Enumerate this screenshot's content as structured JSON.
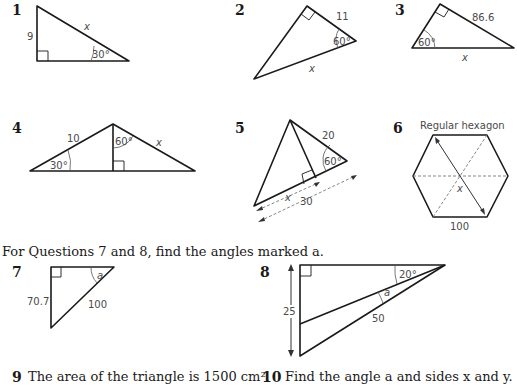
{
  "questions": [
    {
      "number": "1",
      "labels": {
        "side": "9",
        "hypotenuse": "x",
        "angle": "30°"
      }
    },
    {
      "number": "2",
      "labels": {
        "side": "11",
        "angle": "60°",
        "hypotenuse": "x"
      }
    },
    {
      "number": "3",
      "labels": {
        "side": "86.6",
        "angle": "60°",
        "hypotenuse": "x"
      }
    },
    {
      "number": "4",
      "labels": {
        "side_left": "10",
        "angle_left": "30°",
        "angle_top": "60°",
        "side_right": "x"
      }
    },
    {
      "number": "5",
      "labels": {
        "side": "20",
        "angle": "60°",
        "segment": "x",
        "base": "30"
      }
    },
    {
      "number": "6",
      "labels": {
        "title": "Regular hexagon",
        "diagonal": "x",
        "side": "100"
      }
    },
    {
      "number": "7",
      "labels": {
        "side": "70.7",
        "hypotenuse": "100",
        "angle": "a"
      }
    },
    {
      "number": "8",
      "labels": {
        "height": "25",
        "angle": "20°",
        "unknown_angle": "a",
        "side": "50"
      }
    },
    {
      "number": "9",
      "text": "The area of the triangle is 1500 cm²."
    },
    {
      "number": "10",
      "text": "Find the angle a and sides x and y."
    }
  ],
  "instruction": "For Questions 7 and 8, find the angles marked a."
}
